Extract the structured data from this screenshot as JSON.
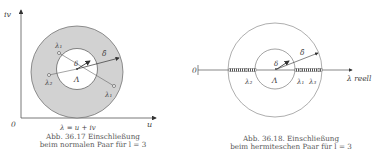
{
  "figure_left": {
    "axis_y_label": "iv",
    "axis_x_label": "u",
    "origin_label": "0",
    "complex_label": "λ = u + iv",
    "center_label": "Λ",
    "inner_radius_label": "δ",
    "outer_radius_label": "δ̂",
    "points": [
      {
        "label": "λ₁",
        "pos": "upper-left"
      },
      {
        "label": "λ₂",
        "pos": "left"
      },
      {
        "label": "λ₁",
        "pos": "lower-right"
      }
    ],
    "caption_line1": "Abb. 36.17 Einschließung",
    "caption_line2": "beim normalen Paar für l = 3",
    "annulus_fill": "#d2d2d2"
  },
  "figure_right": {
    "origin_label": "0",
    "axis_x_label": "λ reell",
    "center_label": "Λ",
    "inner_radius_label": "δ",
    "outer_radius_label": "δ̂",
    "points": [
      {
        "label": "λ₂",
        "pos": "left"
      },
      {
        "label": "λ₁",
        "pos": "right"
      },
      {
        "label": "λ₃",
        "pos": "right"
      }
    ],
    "caption_line1": "Abb. 36.18. Einschließung",
    "caption_line2": "beim hermiteschen Paar für l = 3"
  }
}
